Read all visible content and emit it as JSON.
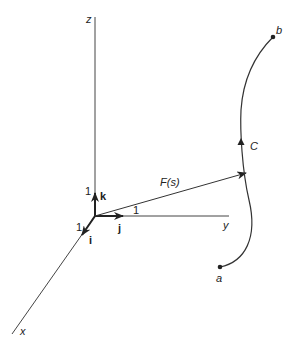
{
  "diagram": {
    "type": "vector-field-curve",
    "axes": {
      "z": {
        "label": "z"
      },
      "y": {
        "label": "y"
      },
      "x": {
        "label": "x"
      }
    },
    "unit_vectors": {
      "k": {
        "label": "k",
        "unit_label": "1"
      },
      "j": {
        "label": "j",
        "unit_label": "1"
      },
      "i": {
        "label": "i",
        "unit_label": "1"
      }
    },
    "position_vector": {
      "label": "F(s)"
    },
    "curve": {
      "label": "C",
      "start_label": "a",
      "end_label": "b"
    },
    "colors": {
      "stroke": "#333333",
      "text": "#222222"
    }
  }
}
